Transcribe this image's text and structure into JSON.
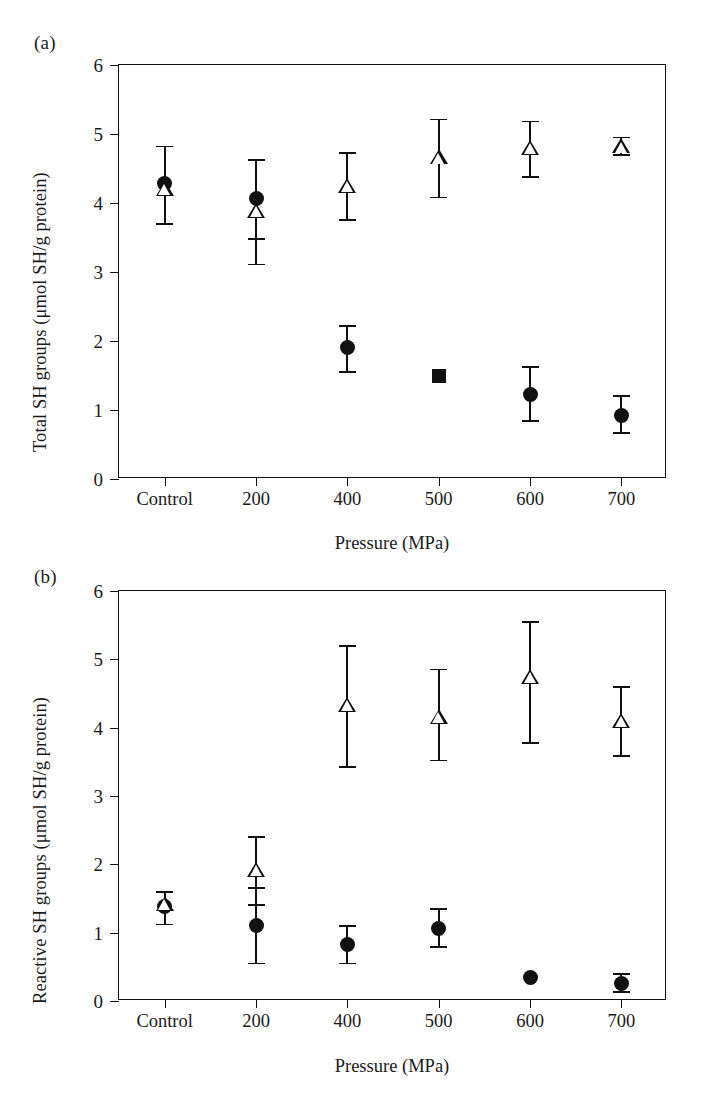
{
  "figure": {
    "panels": [
      {
        "tag": "(a)",
        "ylabel": "Total SH groups (μmol SH/g protein)",
        "xlabel": "Pressure (MPa)"
      },
      {
        "tag": "(b)",
        "ylabel": "Reactive SH groups (μmol SH/g protein)",
        "xlabel": "Pressure (MPa)"
      }
    ]
  },
  "chart_data": [
    {
      "type": "scatter",
      "title": "(a)",
      "xlabel": "Pressure (MPa)",
      "ylabel": "Total SH groups (μmol SH/g protein)",
      "categories": [
        "Control",
        "200",
        "400",
        "500",
        "600",
        "700"
      ],
      "ylim": [
        0,
        6
      ],
      "yticks": [
        0,
        1,
        2,
        3,
        4,
        5,
        6
      ],
      "ytick_labels": [
        "0",
        "1",
        "2",
        "3",
        "4",
        "5",
        "6"
      ],
      "grid": false,
      "legend": "none",
      "series": [
        {
          "name": "filled-circle",
          "marker": "circle",
          "points": [
            {
              "x": "Control",
              "y": 4.28,
              "err_low": 3.7,
              "err_high": 4.82
            },
            {
              "x": "200",
              "y": 4.07,
              "err_low": 3.48,
              "err_high": 4.62
            },
            {
              "x": "400",
              "y": 1.9,
              "err_low": 1.55,
              "err_high": 2.22
            },
            {
              "x": "600",
              "y": 1.22,
              "err_low": 0.84,
              "err_high": 1.62
            },
            {
              "x": "700",
              "y": 0.92,
              "err_low": 0.67,
              "err_high": 1.2
            }
          ]
        },
        {
          "name": "open-triangle",
          "marker": "triangle",
          "points": [
            {
              "x": "Control",
              "y": 4.2,
              "err_low": 3.7,
              "err_high": 4.82
            },
            {
              "x": "200",
              "y": 3.88,
              "err_low": 3.11,
              "err_high": 4.62
            },
            {
              "x": "400",
              "y": 4.25,
              "err_low": 3.75,
              "err_high": 4.73
            },
            {
              "x": "500",
              "y": 4.66,
              "err_low": 4.08,
              "err_high": 5.21
            },
            {
              "x": "600",
              "y": 4.8,
              "err_low": 4.38,
              "err_high": 5.18
            },
            {
              "x": "700",
              "y": 4.82,
              "err_low": 4.7,
              "err_high": 4.95
            }
          ]
        },
        {
          "name": "filled-square",
          "marker": "square",
          "points": [
            {
              "x": "500",
              "y": 1.5,
              "err_low": 1.5,
              "err_high": 1.5
            }
          ]
        }
      ]
    },
    {
      "type": "scatter",
      "title": "(b)",
      "xlabel": "Pressure (MPa)",
      "ylabel": "Reactive SH groups (μmol SH/g protein)",
      "categories": [
        "Control",
        "200",
        "400",
        "500",
        "600",
        "700"
      ],
      "ylim": [
        0,
        6
      ],
      "yticks": [
        0,
        1,
        2,
        3,
        4,
        5,
        6
      ],
      "ytick_labels": [
        "0",
        "1",
        "2",
        "3",
        "4",
        "5",
        "6"
      ],
      "grid": false,
      "legend": "none",
      "series": [
        {
          "name": "filled-circle",
          "marker": "circle",
          "points": [
            {
              "x": "Control",
              "y": 1.38,
              "err_low": 1.12,
              "err_high": 1.6
            },
            {
              "x": "200",
              "y": 1.1,
              "err_low": 0.55,
              "err_high": 1.65
            },
            {
              "x": "400",
              "y": 0.82,
              "err_low": 0.55,
              "err_high": 1.1
            },
            {
              "x": "500",
              "y": 1.06,
              "err_low": 0.79,
              "err_high": 1.35
            },
            {
              "x": "600",
              "y": 0.34,
              "err_low": 0.34,
              "err_high": 0.34
            },
            {
              "x": "700",
              "y": 0.25,
              "err_low": 0.13,
              "err_high": 0.4
            }
          ]
        },
        {
          "name": "open-triangle",
          "marker": "triangle",
          "points": [
            {
              "x": "Control",
              "y": 1.42,
              "err_low": 1.12,
              "err_high": 1.6
            },
            {
              "x": "200",
              "y": 1.92,
              "err_low": 1.4,
              "err_high": 2.4
            },
            {
              "x": "400",
              "y": 4.33,
              "err_low": 3.43,
              "err_high": 5.2
            },
            {
              "x": "500",
              "y": 4.16,
              "err_low": 3.52,
              "err_high": 4.85
            },
            {
              "x": "600",
              "y": 4.74,
              "err_low": 3.78,
              "err_high": 5.55
            },
            {
              "x": "700",
              "y": 4.1,
              "err_low": 3.58,
              "err_high": 4.6
            }
          ]
        }
      ]
    }
  ]
}
